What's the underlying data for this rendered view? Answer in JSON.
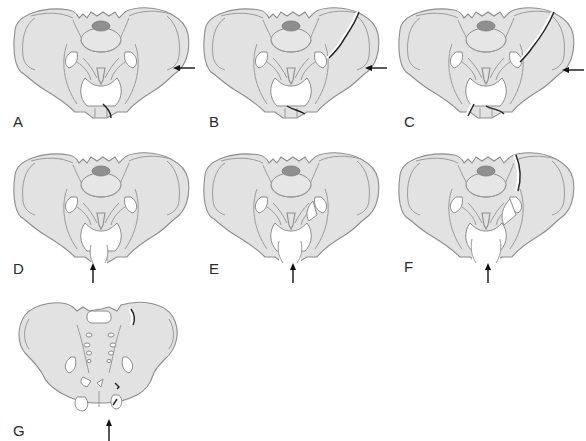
{
  "figure": {
    "colors": {
      "bone_fill": "#e2e2e2",
      "bone_outline": "#8c8c8c",
      "sacral_promontory": "#8f8f8f",
      "fracture_line": "#222222",
      "arrow": "#111111",
      "background": "#ffffff"
    },
    "panels": [
      {
        "id": "A",
        "label": "A",
        "force_direction": "lateral",
        "arrow_side": "right",
        "fracture": "pubic ramus"
      },
      {
        "id": "B",
        "label": "B",
        "force_direction": "lateral",
        "arrow_side": "right",
        "fracture": "iliac wing and pubic symphysis"
      },
      {
        "id": "C",
        "label": "C",
        "force_direction": "lateral",
        "arrow_side": "right",
        "fracture": "iliac wing and bilateral pubic rami"
      },
      {
        "id": "D",
        "label": "D",
        "force_direction": "anteroposterior",
        "arrow_side": "bottom",
        "fracture": "symphysis diastasis"
      },
      {
        "id": "E",
        "label": "E",
        "force_direction": "anteroposterior",
        "arrow_side": "bottom",
        "fracture": "symphysis diastasis with sacroiliac opening"
      },
      {
        "id": "F",
        "label": "F",
        "force_direction": "anteroposterior",
        "arrow_side": "bottom",
        "fracture": "complete sacroiliac disruption"
      },
      {
        "id": "G",
        "label": "G",
        "force_direction": "vertical",
        "arrow_side": "bottom",
        "fracture": "vertical shear through sacroiliac region and pubic rami"
      }
    ]
  }
}
